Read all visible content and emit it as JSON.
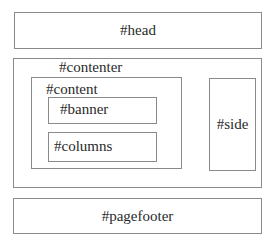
{
  "diagram": {
    "type": "page-layout-wireframe",
    "boxes": {
      "head": {
        "label": "#head"
      },
      "contenter": {
        "label": "#contenter"
      },
      "content": {
        "label": "#content"
      },
      "banner": {
        "label": "#banner"
      },
      "columns": {
        "label": "#columns"
      },
      "side": {
        "label": "#side"
      },
      "pagefooter": {
        "label": "#pagefooter"
      }
    },
    "hierarchy": [
      {
        "id": "head",
        "children": []
      },
      {
        "id": "contenter",
        "children": [
          {
            "id": "content",
            "children": [
              {
                "id": "banner",
                "children": []
              },
              {
                "id": "columns",
                "children": []
              }
            ]
          },
          {
            "id": "side",
            "children": []
          }
        ]
      },
      {
        "id": "pagefooter",
        "children": []
      }
    ],
    "colors": {
      "border": "#8a8a8a",
      "text": "#2a2a2a",
      "background": "#ffffff"
    }
  }
}
